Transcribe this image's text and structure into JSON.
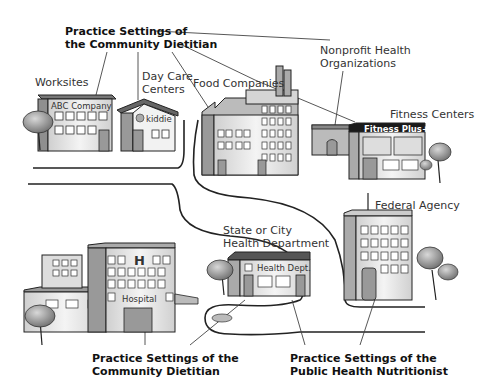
{
  "labels": {
    "top_callout_line1": "Practice Settings of",
    "top_callout_line2": "the Community Dietitian",
    "worksites": "Worksites",
    "day_care_line1": "Day Care",
    "day_care_line2": "Centers",
    "food_companies": "Food Companies",
    "nonprofit_line1": "Nonprofit Health",
    "nonprofit_line2": "Organizations",
    "fitness_centers": "Fitness Centers",
    "federal_agency": "Federal Agency",
    "state_city_line1": "State or City",
    "state_city_line2": "Health Department",
    "bottom_left_line1": "Practice Settings of the",
    "bottom_left_line2": "Community Dietitian",
    "bottom_right_line1": "Practice Settings of the",
    "bottom_right_line2": "Public Health Nutritionist"
  },
  "signs": {
    "abc_company": "ABC Company",
    "kiddie": "kiddie",
    "fitness_plus": "Fitness Plus+",
    "health_dept": "Health Dept.",
    "hospital": "Hospital",
    "hospital_h": "H"
  },
  "colors": {
    "line": "#333333",
    "roof_dark": "#555555",
    "wall_light": "#e6e6e6",
    "wall_mid": "#b5b5b5",
    "tree": "#8a8a8a"
  }
}
